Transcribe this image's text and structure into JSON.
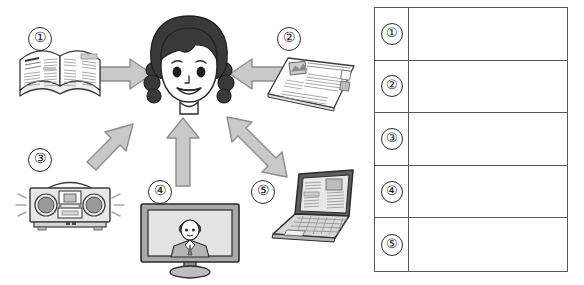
{
  "page": {
    "background": "#ffffff",
    "width": 584,
    "height": 285,
    "type": "worksheet-diagram"
  },
  "colors": {
    "arrow_fill": "#c9c9c9",
    "arrow_stroke": "#8d8d8d",
    "ink": "#2b2b2b",
    "table_border": "#5a5a5a",
    "hair": "#3a3a3a",
    "device_gray": "#bdbdbd",
    "screen_gray": "#d8d8d8"
  },
  "diagram": {
    "center": {
      "label": "girl-listener",
      "description": "smiling girl with braided pigtails"
    },
    "sources": [
      {
        "number": "①",
        "plain_number": "1",
        "name": "magazine",
        "description": "open magazine / book",
        "arrow": "right",
        "arrow_name": "arrow-magazine-to-girl"
      },
      {
        "number": "②",
        "plain_number": "2",
        "name": "newspaper",
        "description": "newspaper in perspective",
        "arrow": "left",
        "arrow_name": "arrow-newspaper-to-girl"
      },
      {
        "number": "③",
        "plain_number": "3",
        "name": "radio",
        "description": "boombox radio with sound lines",
        "arrow": "up-right",
        "arrow_name": "arrow-radio-to-girl"
      },
      {
        "number": "④",
        "plain_number": "4",
        "name": "television",
        "description": "TV monitor showing a news presenter",
        "arrow": "up",
        "arrow_name": "arrow-tv-to-girl"
      },
      {
        "number": "⑤",
        "plain_number": "5",
        "name": "laptop",
        "description": "open laptop computer showing a web page",
        "arrow": "double-up-left-down-right",
        "arrow_name": "arrow-laptop-girl-two-way"
      }
    ]
  },
  "answer_table": {
    "name": "answer-table",
    "column_headers": [
      "",
      ""
    ],
    "rows": [
      {
        "number": "①",
        "answer": ""
      },
      {
        "number": "②",
        "answer": ""
      },
      {
        "number": "③",
        "answer": ""
      },
      {
        "number": "④",
        "answer": ""
      },
      {
        "number": "⑤",
        "answer": ""
      }
    ]
  }
}
